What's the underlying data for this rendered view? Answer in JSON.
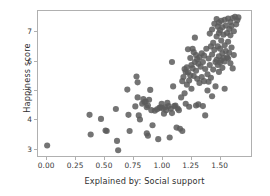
{
  "chart_data": {
    "type": "scatter",
    "title": "",
    "xlabel": "Explained by: Social support",
    "ylabel": "Happiness score",
    "xlim": [
      -0.08,
      1.78
    ],
    "ylim": [
      2.72,
      7.72
    ],
    "xticks": [
      "0.00",
      "0.25",
      "0.50",
      "0.75",
      "1.00",
      "1.25",
      "1.50"
    ],
    "xtick_values": [
      0.0,
      0.25,
      0.5,
      0.75,
      1.0,
      1.25,
      1.5
    ],
    "yticks": [
      "3",
      "4",
      "5",
      "6",
      "7"
    ],
    "ytick_values": [
      3,
      4,
      5,
      6,
      7
    ],
    "grid": false,
    "legend": null,
    "marker_color": "#5c5c5c",
    "marker_size": 3.1,
    "marker_opacity": 0.85,
    "spine_color": "#b0b0b0",
    "background_color": "#ffffff",
    "point_count": 156,
    "points": [
      [
        0.0,
        3.08
      ],
      [
        0.37,
        4.14
      ],
      [
        0.38,
        3.46
      ],
      [
        0.47,
        4.0
      ],
      [
        0.51,
        3.6
      ],
      [
        0.52,
        3.58
      ],
      [
        0.6,
        4.34
      ],
      [
        0.61,
        3.24
      ],
      [
        0.62,
        2.92
      ],
      [
        0.7,
        5.01
      ],
      [
        0.71,
        4.14
      ],
      [
        0.72,
        3.58
      ],
      [
        0.77,
        4.43
      ],
      [
        0.78,
        5.46
      ],
      [
        0.79,
        5.26
      ],
      [
        0.79,
        4.74
      ],
      [
        0.8,
        4.12
      ],
      [
        0.81,
        3.98
      ],
      [
        0.83,
        4.52
      ],
      [
        0.84,
        4.68
      ],
      [
        0.85,
        4.58
      ],
      [
        0.86,
        4.6
      ],
      [
        0.87,
        3.5
      ],
      [
        0.87,
        4.4
      ],
      [
        0.88,
        4.46
      ],
      [
        0.88,
        3.42
      ],
      [
        0.89,
        4.66
      ],
      [
        0.9,
        5.0
      ],
      [
        0.91,
        4.3
      ],
      [
        0.92,
        3.78
      ],
      [
        0.94,
        4.28
      ],
      [
        0.96,
        4.33
      ],
      [
        0.97,
        3.3
      ],
      [
        0.98,
        4.38
      ],
      [
        0.99,
        4.4
      ],
      [
        1.0,
        4.52
      ],
      [
        1.01,
        4.36
      ],
      [
        1.02,
        4.18
      ],
      [
        1.03,
        4.4
      ],
      [
        1.04,
        4.3
      ],
      [
        1.05,
        4.55
      ],
      [
        1.06,
        4.44
      ],
      [
        1.07,
        3.36
      ],
      [
        1.08,
        4.35
      ],
      [
        1.09,
        5.96
      ],
      [
        1.09,
        4.2
      ],
      [
        1.1,
        5.12
      ],
      [
        1.11,
        4.44
      ],
      [
        1.12,
        4.46
      ],
      [
        1.13,
        3.7
      ],
      [
        1.14,
        4.36
      ],
      [
        1.15,
        4.3
      ],
      [
        1.16,
        3.66
      ],
      [
        1.17,
        4.74
      ],
      [
        1.18,
        5.3
      ],
      [
        1.18,
        3.58
      ],
      [
        1.19,
        5.44
      ],
      [
        1.2,
        5.72
      ],
      [
        1.2,
        4.88
      ],
      [
        1.21,
        5.62
      ],
      [
        1.21,
        4.52
      ],
      [
        1.22,
        5.78
      ],
      [
        1.22,
        5.18
      ],
      [
        1.23,
        6.4
      ],
      [
        1.23,
        5.6
      ],
      [
        1.24,
        5.32
      ],
      [
        1.24,
        4.42
      ],
      [
        1.25,
        6.1
      ],
      [
        1.25,
        5.5
      ],
      [
        1.26,
        5.86
      ],
      [
        1.26,
        5.04
      ],
      [
        1.27,
        6.42
      ],
      [
        1.27,
        5.74
      ],
      [
        1.28,
        6.3
      ],
      [
        1.28,
        5.48
      ],
      [
        1.29,
        6.8
      ],
      [
        1.29,
        5.96
      ],
      [
        1.3,
        6.2
      ],
      [
        1.3,
        5.66
      ],
      [
        1.3,
        4.46
      ],
      [
        1.31,
        6.06
      ],
      [
        1.31,
        5.38
      ],
      [
        1.32,
        5.9
      ],
      [
        1.32,
        4.5
      ],
      [
        1.33,
        6.12
      ],
      [
        1.33,
        5.24
      ],
      [
        1.34,
        5.8
      ],
      [
        1.35,
        6.26
      ],
      [
        1.35,
        5.44
      ],
      [
        1.36,
        5.96
      ],
      [
        1.36,
        4.44
      ],
      [
        1.37,
        6.18
      ],
      [
        1.37,
        5.3
      ],
      [
        1.38,
        5.72
      ],
      [
        1.38,
        4.12
      ],
      [
        1.39,
        6.42
      ],
      [
        1.4,
        5.54
      ],
      [
        1.4,
        4.98
      ],
      [
        1.41,
        6.08
      ],
      [
        1.41,
        5.28
      ],
      [
        1.42,
        6.94
      ],
      [
        1.42,
        5.86
      ],
      [
        1.43,
        6.5
      ],
      [
        1.43,
        5.42
      ],
      [
        1.44,
        7.08
      ],
      [
        1.44,
        6.22
      ],
      [
        1.45,
        6.62
      ],
      [
        1.45,
        5.7
      ],
      [
        1.46,
        7.28
      ],
      [
        1.46,
        6.38
      ],
      [
        1.47,
        5.96
      ],
      [
        1.47,
        5.12
      ],
      [
        1.48,
        7.44
      ],
      [
        1.48,
        6.84
      ],
      [
        1.48,
        6.04
      ],
      [
        1.49,
        7.18
      ],
      [
        1.49,
        6.5
      ],
      [
        1.49,
        5.86
      ],
      [
        1.5,
        7.32
      ],
      [
        1.5,
        6.96
      ],
      [
        1.5,
        6.16
      ],
      [
        1.5,
        5.62
      ],
      [
        1.51,
        7.06
      ],
      [
        1.51,
        6.42
      ],
      [
        1.51,
        5.94
      ],
      [
        1.52,
        7.38
      ],
      [
        1.52,
        6.7
      ],
      [
        1.52,
        6.02
      ],
      [
        1.53,
        7.16
      ],
      [
        1.53,
        6.26
      ],
      [
        1.53,
        5.76
      ],
      [
        1.54,
        6.9
      ],
      [
        1.54,
        6.1
      ],
      [
        1.55,
        7.42
      ],
      [
        1.55,
        6.54
      ],
      [
        1.55,
        5.98
      ],
      [
        1.56,
        7.22
      ],
      [
        1.56,
        6.34
      ],
      [
        1.57,
        6.96
      ],
      [
        1.57,
        6.12
      ],
      [
        1.58,
        7.46
      ],
      [
        1.58,
        6.66
      ],
      [
        1.59,
        7.1
      ],
      [
        1.59,
        6.28
      ],
      [
        1.6,
        7.34
      ],
      [
        1.6,
        6.88
      ],
      [
        1.61,
        7.2
      ],
      [
        1.61,
        6.46
      ],
      [
        1.62,
        7.48
      ],
      [
        1.63,
        7.02
      ],
      [
        1.63,
        6.2
      ],
      [
        1.64,
        7.52
      ],
      [
        1.65,
        7.26
      ],
      [
        1.66,
        7.4
      ],
      [
        1.67,
        7.5
      ],
      [
        1.62,
        5.74
      ],
      [
        1.44,
        4.78
      ],
      [
        1.55,
        5.04
      ],
      [
        1.58,
        6.08
      ],
      [
        1.6,
        5.92
      ]
    ]
  }
}
